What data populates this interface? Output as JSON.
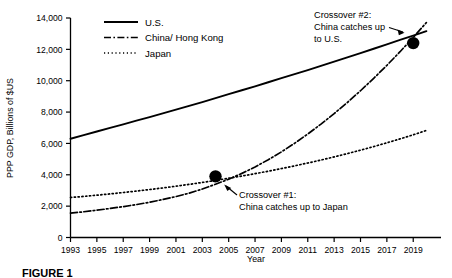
{
  "figure": {
    "caption": "FIGURE 1"
  },
  "chart_data": {
    "type": "line",
    "title": "",
    "xlabel": "Year",
    "ylabel": "PPP GDP, Billions of $US",
    "xlim": [
      1993,
      2020.5
    ],
    "ylim": [
      0,
      14000
    ],
    "grid": false,
    "legend_position": "top-left-inside",
    "xticks": [
      1993,
      1995,
      1997,
      1999,
      2001,
      2003,
      2005,
      2007,
      2009,
      2011,
      2013,
      2015,
      2017,
      2019
    ],
    "xtick_labels": [
      "1993",
      "1995",
      "1997",
      "1999",
      "2001",
      "2003",
      "2005",
      "2007",
      "2009",
      "2011",
      "2013",
      "2015",
      "2017",
      "2019"
    ],
    "yticks": [
      0,
      2000,
      4000,
      6000,
      8000,
      10000,
      12000,
      14000
    ],
    "ytick_labels": [
      "0",
      "2,000",
      "4,000",
      "6,000",
      "8,000",
      "10,000",
      "12,000",
      "14,000"
    ],
    "x": [
      1993,
      1994,
      1995,
      1996,
      1997,
      1998,
      1999,
      2000,
      2001,
      2002,
      2003,
      2004,
      2005,
      2006,
      2007,
      2008,
      2009,
      2010,
      2011,
      2012,
      2013,
      2014,
      2015,
      2016,
      2017,
      2018,
      2019,
      2020
    ],
    "series": [
      {
        "name": "U.S.",
        "style": "solid",
        "values": [
          6300,
          6530,
          6760,
          6990,
          7220,
          7450,
          7680,
          7920,
          8160,
          8400,
          8640,
          8890,
          9140,
          9390,
          9640,
          9900,
          10160,
          10420,
          10680,
          10950,
          11220,
          11490,
          11760,
          12040,
          12320,
          12600,
          12880,
          13160
        ]
      },
      {
        "name": "China/ Hong Kong",
        "style": "dash-dot",
        "values": [
          1550,
          1640,
          1740,
          1850,
          1970,
          2100,
          2250,
          2420,
          2610,
          2830,
          3090,
          3400,
          3720,
          4090,
          4500,
          4960,
          5460,
          6010,
          6600,
          7230,
          7900,
          8610,
          9360,
          10150,
          10980,
          11850,
          12760,
          13710
        ]
      },
      {
        "name": "Japan",
        "style": "dotted",
        "values": [
          2550,
          2620,
          2700,
          2780,
          2870,
          2960,
          3060,
          3160,
          3270,
          3390,
          3510,
          3640,
          3780,
          3920,
          4070,
          4230,
          4400,
          4570,
          4750,
          4940,
          5140,
          5350,
          5570,
          5800,
          6040,
          6290,
          6550,
          6830
        ]
      }
    ],
    "legend": [
      {
        "label": "U.S.",
        "style": "solid"
      },
      {
        "label": "China/ Hong Kong",
        "style": "dash-dot"
      },
      {
        "label": "Japan",
        "style": "dotted"
      }
    ],
    "markers": [
      {
        "name": "crossover-1",
        "x": 2004,
        "y": 3900
      },
      {
        "name": "crossover-2",
        "x": 2019,
        "y": 12400
      }
    ],
    "annotations": [
      {
        "name": "crossover-2",
        "lines": [
          "Crossover #2:",
          "China catches up",
          "to U.S."
        ],
        "points_to": "crossover-2-marker"
      },
      {
        "name": "crossover-1",
        "lines": [
          "Crossover #1:",
          "China catches up to Japan"
        ],
        "points_to": "crossover-1-marker"
      }
    ]
  }
}
